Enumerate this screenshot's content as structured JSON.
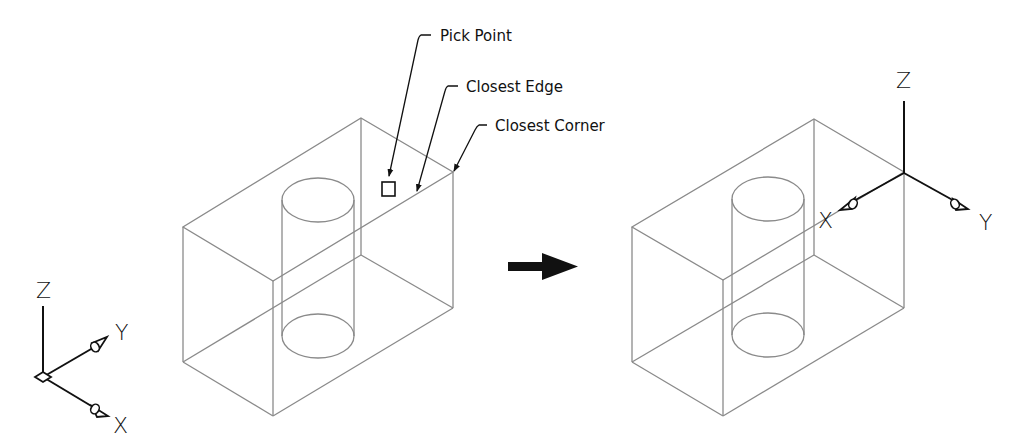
{
  "figure": {
    "left_view": {
      "callouts": [
        {
          "label": "Pick Point"
        },
        {
          "label": "Closest Edge"
        },
        {
          "label": "Closest Corner"
        }
      ],
      "ucs_icon": {
        "axes": {
          "z": "Z",
          "y": "Y",
          "x": "X"
        }
      }
    },
    "transition": {
      "icon": "right-arrow-icon"
    },
    "right_view": {
      "ucs_icon": {
        "axes": {
          "z": "Z",
          "x": "X",
          "y": "Y"
        }
      }
    },
    "colors": {
      "edge": "#8a8a8a",
      "annotation": "#111111",
      "background": "#ffffff"
    }
  }
}
